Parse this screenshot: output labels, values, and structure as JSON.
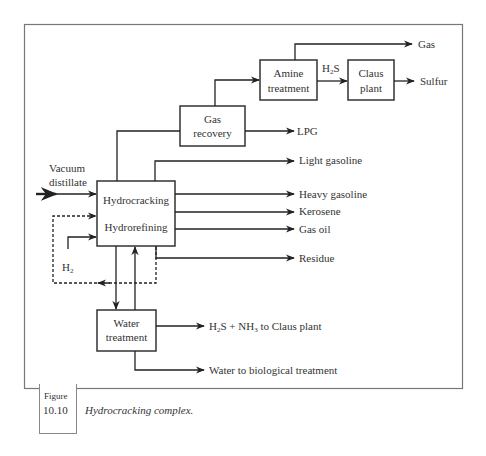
{
  "diagram": {
    "type": "process-flow",
    "units": {
      "hydro": {
        "line1": "Hydrocracking",
        "line2": "Hydrorefining"
      },
      "gas_recovery": {
        "line1": "Gas",
        "line2": "recovery"
      },
      "amine": {
        "line1": "Amine",
        "line2": "treatment"
      },
      "claus": {
        "line1": "Claus",
        "line2": "plant"
      },
      "water": {
        "line1": "Water",
        "line2": "treatment"
      }
    },
    "inputs": {
      "feed_line1": "Vacuum",
      "feed_line2": "distillate",
      "h2": "H",
      "h2_sub": "2"
    },
    "streams": {
      "h2s_base": "H",
      "h2s_sub": "2",
      "h2s_tail": "S"
    },
    "outputs": {
      "gas": "Gas",
      "sulfur": "Sulfur",
      "lpg": "LPG",
      "light_gasoline": "Light gasoline",
      "heavy_gasoline": "Heavy gasoline",
      "kerosene": "Kerosene",
      "gas_oil": "Gas oil",
      "residue": "Residue",
      "h2s_nh3_a": "H",
      "h2s_nh3_sub1": "2",
      "h2s_nh3_b": "S + NH",
      "h2s_nh3_sub2": "3",
      "h2s_nh3_c": " to Claus plant",
      "water_bio": "Water to biological treatment"
    },
    "edges": [
      {
        "from": "feed",
        "to": "hydro"
      },
      {
        "from": "h2",
        "to": "hydro"
      },
      {
        "from": "hydro",
        "to": "gas_recovery"
      },
      {
        "from": "gas_recovery",
        "to": "amine"
      },
      {
        "from": "gas_recovery",
        "to": "LPG"
      },
      {
        "from": "amine",
        "to": "Gas"
      },
      {
        "from": "amine",
        "to": "claus",
        "label": "H2S"
      },
      {
        "from": "claus",
        "to": "Sulfur"
      },
      {
        "from": "hydro",
        "to": "Light gasoline"
      },
      {
        "from": "hydro",
        "to": "Heavy gasoline"
      },
      {
        "from": "hydro",
        "to": "Kerosene"
      },
      {
        "from": "hydro",
        "to": "Gas oil"
      },
      {
        "from": "hydro",
        "to": "Residue"
      },
      {
        "from": "hydro",
        "to": "hydro",
        "style": "dashed",
        "label": "recycle"
      },
      {
        "from": "hydro",
        "to": "water"
      },
      {
        "from": "water",
        "to": "hydro"
      },
      {
        "from": "water",
        "to": "H2S + NH3 to Claus plant"
      },
      {
        "from": "water",
        "to": "Water to biological treatment"
      }
    ]
  },
  "figure": {
    "word": "Figure",
    "number": "10.10",
    "caption": "Hydrocracking complex."
  }
}
